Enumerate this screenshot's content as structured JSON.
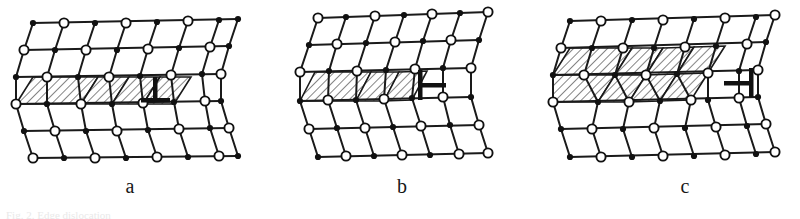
{
  "figure": {
    "panels": [
      {
        "id": "a",
        "label": "a",
        "dislocation_symbol": "⊥",
        "dislocation_symbol_name": "up-tack-dislocation-icon",
        "slipped_rows": 1,
        "slipped_cells_per_row": 4,
        "lattice_rows": 6,
        "lattice_cols": 9
      },
      {
        "id": "b",
        "label": "b",
        "dislocation_symbol": "⊢",
        "dislocation_symbol_name": "right-tack-dislocation-icon",
        "slipped_rows": 1,
        "slipped_cells_per_row": 3,
        "lattice_rows": 6,
        "lattice_cols": 8
      },
      {
        "id": "c",
        "label": "c",
        "dislocation_symbol": "⊣",
        "dislocation_symbol_name": "left-tack-dislocation-icon",
        "slipped_rows": 2,
        "slipped_cells_per_row": 4,
        "lattice_rows": 6,
        "lattice_cols": 9
      }
    ],
    "caption": "Fig. 2. Edge dislocation",
    "colors": {
      "line": "#1a1a1a",
      "atom_open_fill": "#ffffff",
      "atom_filled": "#111111",
      "hatch": "#333333",
      "background": "#ffffff"
    }
  }
}
